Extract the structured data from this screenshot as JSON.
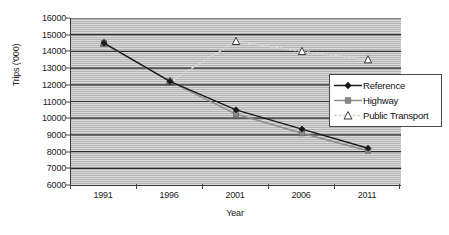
{
  "chart_data": {
    "type": "line",
    "title": "",
    "xlabel": "Year",
    "ylabel": "Trips ('000)",
    "categories": [
      "1991",
      "1996",
      "2001",
      "2006",
      "2011"
    ],
    "ylim": [
      6000,
      16000
    ],
    "ytick_step": 1000,
    "yticks": [
      "16000",
      "15000",
      "14000",
      "13000",
      "12000",
      "11000",
      "10000",
      "9000",
      "8000",
      "7000",
      "6000"
    ],
    "grid": "horizontal",
    "legend_position": "center-right",
    "series": [
      {
        "name": "Reference",
        "values": [
          14500,
          12200,
          10500,
          9350,
          8200
        ],
        "color": "#1a1a1a",
        "marker": "diamond",
        "line": "solid"
      },
      {
        "name": "Highway",
        "values": [
          14500,
          12200,
          10250,
          9100,
          8050
        ],
        "color": "#8c8c8c",
        "marker": "square",
        "line": "solid"
      },
      {
        "name": "Public Transport",
        "values": [
          14500,
          12200,
          14600,
          14000,
          13500
        ],
        "color": "#d8d8d8",
        "marker": "triangle-open",
        "line": "dashed"
      }
    ]
  },
  "legend": {
    "items": [
      {
        "label": "Reference"
      },
      {
        "label": "Highway"
      },
      {
        "label": "Public Transport"
      }
    ]
  },
  "colors": {
    "plot_background": "#b4b4b4",
    "gridline": "#2b2b2b",
    "axis": "#3a3a3a",
    "text": "#222222"
  }
}
